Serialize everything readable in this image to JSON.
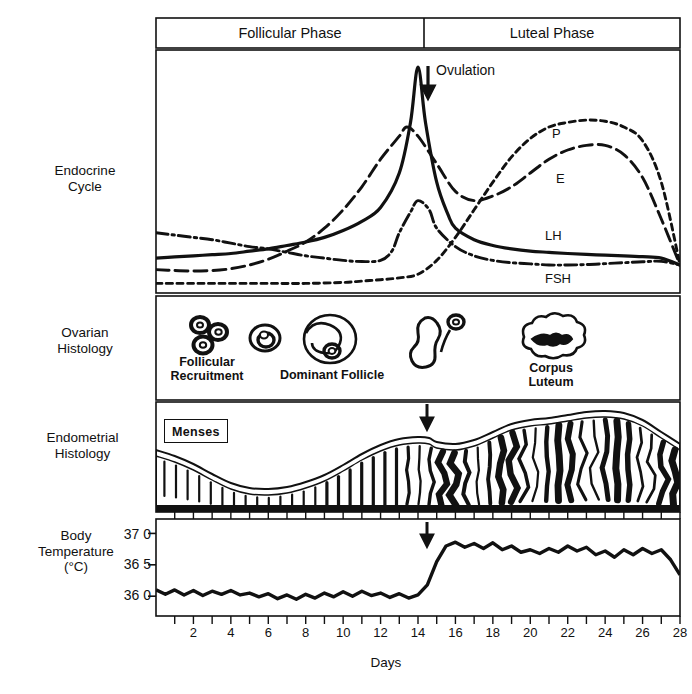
{
  "figure": {
    "title_rows": [
      {
        "id": "endocrine",
        "label_line1": "Endocrine",
        "label_line2": "Cycle"
      },
      {
        "id": "ovarian",
        "label_line1": "Ovarian",
        "label_line2": "Histology"
      },
      {
        "id": "endometrial",
        "label_line1": "Endometrial",
        "label_line2": "Histology"
      },
      {
        "id": "temperature",
        "label_line1": "Body",
        "label_line2": "Temperature",
        "label_line3": "(°C)"
      }
    ],
    "phases": [
      {
        "name": "Follicular Phase",
        "start_day": 0,
        "end_day": 14
      },
      {
        "name": "Luteal Phase",
        "start_day": 14,
        "end_day": 28
      }
    ],
    "ovulation": {
      "label": "Ovulation",
      "day": 14.5
    },
    "axis": {
      "x_title": "Days",
      "x_ticks": [
        2,
        4,
        6,
        8,
        10,
        12,
        14,
        16,
        18,
        20,
        22,
        24,
        26,
        28
      ],
      "x_min": 0,
      "x_max": 28,
      "y_ticks_temperature": [
        "37 0",
        "36 5",
        "36 0"
      ],
      "y_min_temperature": 35.78,
      "y_max_temperature": 37.15
    },
    "colors": {
      "ink": "#111111",
      "paper": "#ffffff",
      "frame": "#111111"
    }
  },
  "chart_data": [
    {
      "type": "line",
      "id": "endocrine-cycle",
      "title": "Endocrine Cycle",
      "xlabel": "Days",
      "ylabel": "",
      "xlim": [
        0,
        28
      ],
      "ylim": [
        0,
        100
      ],
      "grid": false,
      "legend": "inline-right",
      "annotations": [
        {
          "text": "Ovulation",
          "day": 14.5
        }
      ],
      "series": [
        {
          "name": "LH",
          "style": "solid",
          "label_day": 24.0,
          "label_value": 17,
          "x": [
            0,
            1,
            2,
            3,
            4,
            5,
            6,
            7,
            8,
            9,
            10,
            11,
            12,
            13,
            13.6,
            14,
            14.4,
            15,
            15.6,
            16,
            17,
            18,
            19,
            20,
            21,
            22,
            23,
            24,
            25,
            26,
            27,
            28
          ],
          "y": [
            13,
            13.5,
            14,
            14.5,
            15,
            16,
            17,
            18.5,
            20,
            22,
            25,
            29,
            35,
            50,
            72,
            96,
            72,
            46,
            32,
            26,
            21,
            18.5,
            17,
            16,
            15.5,
            15,
            14.6,
            14.3,
            14,
            13.6,
            13,
            10
          ]
        },
        {
          "name": "FSH",
          "style": "dash-dot",
          "label_day": 24.0,
          "label_value": 4,
          "x": [
            0,
            1,
            2,
            3,
            4,
            5,
            6,
            7,
            8,
            9,
            10,
            11,
            12,
            12.6,
            13,
            13.6,
            14,
            14.6,
            15,
            16,
            17,
            18,
            19,
            20,
            21,
            22,
            23,
            24,
            25,
            26,
            27,
            28
          ],
          "y": [
            24,
            23,
            22,
            21,
            19.5,
            18,
            17,
            15.5,
            14,
            13,
            12,
            11.5,
            12,
            16,
            24,
            33,
            38,
            34,
            26,
            18,
            14,
            12,
            11,
            10.5,
            10,
            10,
            10.2,
            10.6,
            11,
            11.4,
            11.6,
            10
          ]
        },
        {
          "name": "E",
          "style": "long-dash",
          "label_day": 24.2,
          "label_value": 47,
          "x": [
            0,
            1,
            2,
            3,
            4,
            5,
            6,
            7,
            8,
            9,
            10,
            11,
            12,
            13,
            13.4,
            14,
            15,
            16,
            17,
            18,
            19,
            20,
            21,
            22,
            23,
            24,
            25,
            26,
            27,
            28
          ],
          "y": [
            8,
            7.6,
            7.4,
            7.6,
            8.4,
            10,
            12.5,
            16,
            20,
            26,
            34,
            44,
            56,
            66,
            70,
            66,
            54,
            42,
            38,
            40,
            44,
            50,
            56,
            60,
            62,
            62,
            58,
            48,
            30,
            10
          ]
        },
        {
          "name": "P",
          "style": "short-dash",
          "label_day": 23.5,
          "label_value": 78,
          "x": [
            0,
            2,
            4,
            6,
            8,
            10,
            11,
            12,
            13,
            14,
            15,
            16,
            17,
            18,
            19,
            20,
            21,
            22,
            23,
            24,
            25,
            26,
            27,
            28
          ],
          "y": [
            2,
            2,
            2,
            2,
            2,
            2.4,
            3,
            3.6,
            4.4,
            6,
            12,
            22,
            34,
            46,
            57,
            65,
            70,
            72,
            73,
            72.5,
            70,
            64,
            46,
            10
          ]
        }
      ]
    },
    {
      "type": "line",
      "id": "basal-body-temperature",
      "title": "Body Temperature (°C)",
      "xlabel": "Days",
      "ylabel": "Body Temperature (°C)",
      "xlim": [
        0,
        28
      ],
      "ylim": [
        35.78,
        37.15
      ],
      "grid": false,
      "annotations": [
        {
          "text": "ovulation-arrow",
          "day": 14.5
        }
      ],
      "x": [
        0,
        0.5,
        1,
        1.5,
        2,
        2.5,
        3,
        3.5,
        4,
        4.5,
        5,
        5.5,
        6,
        6.5,
        7,
        7.5,
        8,
        8.5,
        9,
        9.5,
        10,
        10.5,
        11,
        11.5,
        12,
        12.5,
        13,
        13.5,
        14,
        14.5,
        15,
        15.5,
        16,
        16.5,
        17,
        17.5,
        18,
        18.5,
        19,
        19.5,
        20,
        20.5,
        21,
        21.5,
        22,
        22.5,
        23,
        23.5,
        24,
        24.5,
        25,
        25.5,
        26,
        26.5,
        27,
        27.5,
        28
      ],
      "y": [
        36.1,
        36.03,
        36.1,
        36.02,
        36.09,
        36.01,
        36.08,
        36.03,
        36.09,
        36.02,
        36.05,
        35.99,
        36.04,
        35.96,
        36.02,
        35.95,
        36.03,
        35.97,
        36.05,
        35.99,
        36.07,
        36.0,
        36.08,
        36.01,
        36.05,
        35.98,
        36.04,
        35.97,
        36.02,
        36.18,
        36.55,
        36.8,
        36.86,
        36.78,
        36.84,
        36.76,
        36.85,
        36.74,
        36.8,
        36.7,
        36.74,
        36.68,
        36.76,
        36.7,
        36.8,
        36.72,
        36.78,
        36.66,
        36.72,
        36.62,
        36.74,
        36.66,
        36.76,
        36.68,
        36.74,
        36.58,
        36.34
      ]
    }
  ],
  "ovarian_histology": {
    "labels": [
      {
        "text_line1": "Follicular",
        "text_line2": "Recruitment",
        "day": 3.2
      },
      {
        "text_line1": "Dominant Follicle",
        "text_line2": "",
        "day": 10.5
      },
      {
        "text_line1": "Corpus",
        "text_line2": "Luteum",
        "day": 22.8
      }
    ]
  },
  "endometrial_histology": {
    "menses_label": "Menses"
  }
}
